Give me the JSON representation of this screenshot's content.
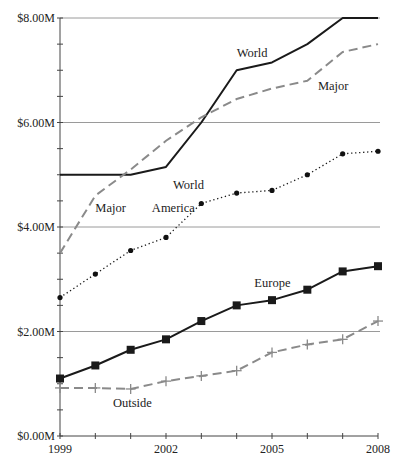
{
  "chart_data": {
    "type": "line",
    "title": "",
    "xlabel": "",
    "ylabel": "",
    "x": [
      1999,
      2000,
      2001,
      2002,
      2003,
      2004,
      2005,
      2006,
      2007,
      2008
    ],
    "xticks_labeled": [
      "1999",
      "2002",
      "2005",
      "2008"
    ],
    "xtick_label_values": [
      1999,
      2002,
      2005,
      2008
    ],
    "yticks_labeled": [
      "$0.00M",
      "$2.00M",
      "$4.00M",
      "$6.00M",
      "$8.00M"
    ],
    "ytick_label_values": [
      0,
      2,
      4,
      6,
      8
    ],
    "y_minor_step": 0.5,
    "ylim": [
      0,
      8
    ],
    "xlim": [
      1999,
      2008
    ],
    "grid": "horizontal at labeled y ticks",
    "legend": "inline labels next to lines",
    "series": [
      {
        "name": "World",
        "style": "solid",
        "marker": "none",
        "color": "#1a1a1a",
        "values": [
          5.0,
          5.0,
          5.0,
          5.15,
          6.0,
          7.0,
          7.15,
          7.5,
          8.0,
          8.0
        ],
        "labels": [
          {
            "text": "World",
            "x": 2002.2,
            "y": 4.72
          },
          {
            "text": "World",
            "x": 2004.0,
            "y": 7.25
          }
        ]
      },
      {
        "name": "Major",
        "style": "dashed",
        "marker": "none",
        "color": "#8a8a8a",
        "values": [
          3.5,
          4.6,
          5.1,
          5.65,
          6.1,
          6.45,
          6.65,
          6.8,
          7.35,
          7.5
        ],
        "labels": [
          {
            "text": "Major",
            "x": 2000.0,
            "y": 4.28
          },
          {
            "text": "Major",
            "x": 2006.3,
            "y": 6.63
          }
        ]
      },
      {
        "name": "America",
        "style": "dotted",
        "marker": "circle",
        "color": "#1a1a1a",
        "values": [
          2.65,
          3.1,
          3.55,
          3.8,
          4.45,
          4.65,
          4.7,
          5.0,
          5.4,
          5.45
        ],
        "labels": [
          {
            "text": "America",
            "x": 2001.6,
            "y": 4.28
          }
        ]
      },
      {
        "name": "Europe",
        "style": "solid",
        "marker": "square",
        "color": "#1a1a1a",
        "values": [
          1.1,
          1.35,
          1.65,
          1.85,
          2.2,
          2.5,
          2.6,
          2.8,
          3.15,
          3.25
        ],
        "labels": [
          {
            "text": "Europe",
            "x": 2004.5,
            "y": 2.85
          }
        ]
      },
      {
        "name": "Outside",
        "style": "dashed",
        "marker": "plus",
        "color": "#8a8a8a",
        "values": [
          0.92,
          0.92,
          0.9,
          1.05,
          1.15,
          1.25,
          1.6,
          1.75,
          1.85,
          2.2
        ],
        "labels": [
          {
            "text": "Outside",
            "x": 2000.5,
            "y": 0.55
          }
        ]
      }
    ]
  }
}
